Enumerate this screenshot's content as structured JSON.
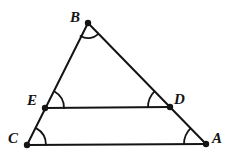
{
  "figure": {
    "type": "geometry-diagram",
    "width": 237,
    "height": 165,
    "background_color": "#ffffff",
    "stroke_color": "#141414",
    "label_color": "#141414"
  },
  "labels": {
    "b": "B",
    "e": "E",
    "d": "D",
    "c": "C",
    "a": "A"
  },
  "points": {
    "B": {
      "name": "B",
      "x": 88,
      "y": 23
    },
    "E": {
      "name": "E",
      "x": 45,
      "y": 108
    },
    "D": {
      "name": "D",
      "x": 170,
      "y": 107
    },
    "C": {
      "name": "C",
      "x": 27,
      "y": 145
    },
    "A": {
      "name": "A",
      "x": 206,
      "y": 144
    }
  },
  "label_positions": {
    "B": {
      "x": 70,
      "y": 10
    },
    "E": {
      "x": 27,
      "y": 93
    },
    "D": {
      "x": 174,
      "y": 92
    },
    "C": {
      "x": 8,
      "y": 131
    },
    "A": {
      "x": 212,
      "y": 131
    }
  },
  "segments": [
    {
      "name": "segment-BC",
      "from": "B",
      "to": "C"
    },
    {
      "name": "segment-BA",
      "from": "B",
      "to": "A"
    },
    {
      "name": "segment-ED",
      "from": "E",
      "to": "D"
    },
    {
      "name": "segment-CA",
      "from": "C",
      "to": "A"
    }
  ],
  "angle_marks": [
    {
      "name": "angle-B",
      "vertex": "B",
      "radius": 15
    },
    {
      "name": "angle-E",
      "vertex": "E",
      "radius": 19
    },
    {
      "name": "angle-D",
      "vertex": "D",
      "radius": 22
    },
    {
      "name": "angle-C",
      "vertex": "C",
      "radius": 19
    },
    {
      "name": "angle-A",
      "vertex": "A",
      "radius": 22
    }
  ]
}
